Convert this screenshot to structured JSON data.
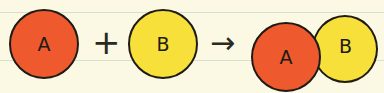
{
  "diagram": {
    "colors": {
      "background": "#fbf8e4",
      "ruled_line": "#d7e0cc",
      "reactant_a": "#ee5a2e",
      "reactant_b": "#f7e03a",
      "outline": "#1e1a14"
    },
    "reactants": [
      {
        "label": "A",
        "color": "reactant_a"
      },
      {
        "label": "B",
        "color": "reactant_b"
      }
    ],
    "operator_plus": "+",
    "operator_arrow": "→",
    "product": [
      {
        "label": "A",
        "color": "reactant_a"
      },
      {
        "label": "B",
        "color": "reactant_b"
      }
    ]
  }
}
